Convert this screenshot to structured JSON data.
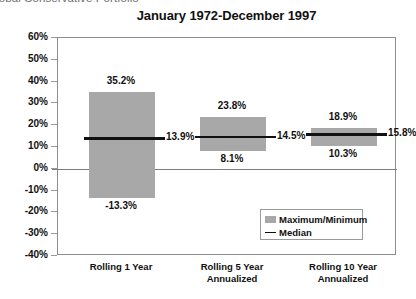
{
  "header": {
    "clipped_text": "lobal Conservative Portfolio"
  },
  "chart_data": {
    "type": "bar",
    "title": "January 1972-December 1997",
    "xlabel": "",
    "ylabel": "",
    "ylim": [
      -40,
      60
    ],
    "ytick_step": 10,
    "ytick_labels": [
      "60%",
      "50%",
      "40%",
      "30%",
      "20%",
      "10%",
      "0%",
      "-10%",
      "-20%",
      "-30%",
      "-40%"
    ],
    "ytick_values": [
      60,
      50,
      40,
      30,
      20,
      10,
      0,
      -10,
      -20,
      -30,
      -40
    ],
    "grid": false,
    "zero_line": true,
    "legend_position": "inside-bottom-right",
    "categories": [
      "Rolling 1 Year",
      "Rolling 5 Year Annualized",
      "Rolling 10 Year Annualized"
    ],
    "category_lines": [
      [
        "Rolling 1 Year"
      ],
      [
        "Rolling 5 Year",
        "Annualized"
      ],
      [
        "Rolling 10 Year",
        "Annualized"
      ]
    ],
    "series": [
      {
        "name": "Maximum/Minimum",
        "type": "range-bar",
        "color": "#a8a8a8",
        "max_values": [
          35.2,
          23.8,
          18.9
        ],
        "min_values": [
          -13.3,
          8.1,
          10.3
        ]
      },
      {
        "name": "Median",
        "type": "marker-line",
        "color": "#111111",
        "values": [
          13.9,
          14.5,
          15.8
        ]
      }
    ],
    "point_labels": {
      "max": [
        "35.2%",
        "23.8%",
        "18.9%"
      ],
      "median": [
        "13.9%",
        "14.5%",
        "15.8%"
      ],
      "min": [
        "-13.3%",
        "8.1%",
        "10.3%"
      ]
    },
    "legend": [
      {
        "label": "Maximum/Minimum",
        "marker": "swatch",
        "color": "#a8a8a8"
      },
      {
        "label": "Median",
        "marker": "dash",
        "color": "#111111"
      }
    ]
  }
}
